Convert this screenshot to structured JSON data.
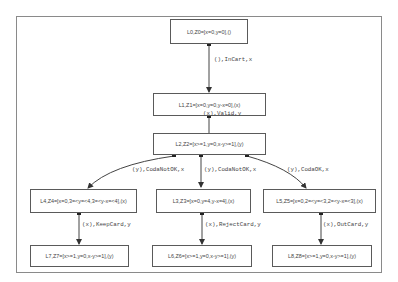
{
  "diagram": {
    "type": "state-transition-graph",
    "nodes": [
      {
        "id": "L0",
        "label": "L0,Z0=[x=0,y=0],()"
      },
      {
        "id": "L1",
        "label": "L1,Z1=[x=0,y=0,y-x=0],(x)"
      },
      {
        "id": "L2",
        "label": "L2,Z2=[x>=1,y=0,x-y>=1],(y)"
      },
      {
        "id": "L4",
        "label": "L4,Z4=[x=0,3=<y=<4,3=<y-x=<4],(x)"
      },
      {
        "id": "L3",
        "label": "L3,Z3=[x=0,y=4,y-x=4],(x)"
      },
      {
        "id": "L5",
        "label": "L5,Z5=[x=0,2=<y=<3,2=<y-x=<3],(x)"
      },
      {
        "id": "L7",
        "label": "L7,Z7=[x>=1,y=0,x-y>=1],(y)"
      },
      {
        "id": "L6",
        "label": "L6,Z6=[x>=1,y=0,x-y>=1],(y)"
      },
      {
        "id": "L8",
        "label": "L8,Z8=[x>=1,y=0,x-y>=1],(y)"
      }
    ],
    "edges": [
      {
        "from": "L0",
        "to": "L1",
        "label": "(),InCart,x"
      },
      {
        "from": "L1",
        "to": "L2",
        "label": "(x),Valid,y"
      },
      {
        "from": "L2",
        "to": "L4",
        "label": "(y),CodaNotOK,x"
      },
      {
        "from": "L2",
        "to": "L3",
        "label": "(y),CodaNotOK,x"
      },
      {
        "from": "L2",
        "to": "L5",
        "label": "(y),CodaOK,x"
      },
      {
        "from": "L4",
        "to": "L7",
        "label": "(x),KeepCard,y"
      },
      {
        "from": "L3",
        "to": "L6",
        "label": "(x),RejectCard,y"
      },
      {
        "from": "L5",
        "to": "L8",
        "label": "(x),OutCard,y"
      }
    ]
  }
}
